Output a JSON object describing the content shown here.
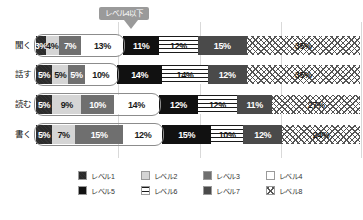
{
  "callout": {
    "text": "レベル4以下"
  },
  "legend": {
    "items": [
      {
        "label": "レベル1",
        "key": "lv1",
        "color": "#2b2b2b"
      },
      {
        "label": "レベル2",
        "key": "lv2",
        "color": "#d5d5d5"
      },
      {
        "label": "レベル3",
        "key": "lv3",
        "color": "#6f6f6f"
      },
      {
        "label": "レベル4",
        "key": "lv4",
        "color": "#ffffff"
      },
      {
        "label": "レベル5",
        "key": "lv5",
        "color": "#111111"
      },
      {
        "label": "レベル6",
        "key": "lv6",
        "color": "#ffffff"
      },
      {
        "label": "レベル7",
        "key": "lv7",
        "color": "#4a4a4a"
      },
      {
        "label": "レベル8",
        "key": "lv8",
        "color": "#ffffff"
      }
    ]
  },
  "chart_data": {
    "type": "bar",
    "orientation": "horizontal",
    "stacked": true,
    "title": "",
    "xlabel": "",
    "ylabel": "",
    "xlim": [
      0,
      100
    ],
    "grid": true,
    "legend_position": "bottom",
    "categories": [
      "聞く",
      "話す",
      "読む",
      "書く"
    ],
    "series": [
      {
        "name": "レベル1",
        "values": [
          3,
          5,
          5,
          5
        ]
      },
      {
        "name": "レベル2",
        "values": [
          4,
          5,
          9,
          7
        ]
      },
      {
        "name": "レベル3",
        "values": [
          7,
          5,
          10,
          15
        ]
      },
      {
        "name": "レベル4",
        "values": [
          13,
          10,
          14,
          12
        ]
      },
      {
        "name": "レベル5",
        "values": [
          11,
          14,
          12,
          15
        ]
      },
      {
        "name": "レベル6",
        "values": [
          12,
          14,
          12,
          10
        ]
      },
      {
        "name": "レベル7",
        "values": [
          15,
          12,
          11,
          12
        ]
      },
      {
        "name": "レベル8",
        "values": [
          35,
          35,
          27,
          24
        ]
      }
    ],
    "rows": [
      {
        "label": "聞く",
        "segments": [
          {
            "level": "レベル1",
            "value": 3,
            "label": "3%"
          },
          {
            "level": "レベル2",
            "value": 4,
            "label": "4%"
          },
          {
            "level": "レベル3",
            "value": 7,
            "label": "7%"
          },
          {
            "level": "レベル4",
            "value": 13,
            "label": "13%"
          },
          {
            "level": "レベル5",
            "value": 11,
            "label": "11%"
          },
          {
            "level": "レベル6",
            "value": 12,
            "label": "12%"
          },
          {
            "level": "レベル7",
            "value": 15,
            "label": "15%"
          },
          {
            "level": "レベル8",
            "value": 35,
            "label": "35%"
          }
        ]
      },
      {
        "label": "話す",
        "segments": [
          {
            "level": "レベル1",
            "value": 5,
            "label": "5%"
          },
          {
            "level": "レベル2",
            "value": 5,
            "label": "5%"
          },
          {
            "level": "レベル3",
            "value": 5,
            "label": "5%"
          },
          {
            "level": "レベル4",
            "value": 10,
            "label": "10%"
          },
          {
            "level": "レベル5",
            "value": 14,
            "label": "14%"
          },
          {
            "level": "レベル6",
            "value": 14,
            "label": "14%"
          },
          {
            "level": "レベル7",
            "value": 12,
            "label": "12%"
          },
          {
            "level": "レベル8",
            "value": 35,
            "label": "35%"
          }
        ]
      },
      {
        "label": "読む",
        "segments": [
          {
            "level": "レベル1",
            "value": 5,
            "label": "5%"
          },
          {
            "level": "レベル2",
            "value": 9,
            "label": "9%"
          },
          {
            "level": "レベル3",
            "value": 10,
            "label": "10%"
          },
          {
            "level": "レベル4",
            "value": 14,
            "label": "14%"
          },
          {
            "level": "レベル5",
            "value": 12,
            "label": "12%"
          },
          {
            "level": "レベル6",
            "value": 12,
            "label": "12%"
          },
          {
            "level": "レベル7",
            "value": 11,
            "label": "11%"
          },
          {
            "level": "レベル8",
            "value": 27,
            "label": "27%"
          }
        ]
      },
      {
        "label": "書く",
        "segments": [
          {
            "level": "レベル1",
            "value": 5,
            "label": "5%"
          },
          {
            "level": "レベル2",
            "value": 7,
            "label": "7%"
          },
          {
            "level": "レベル3",
            "value": 15,
            "label": "15%"
          },
          {
            "level": "レベル4",
            "value": 12,
            "label": "12%"
          },
          {
            "level": "レベル5",
            "value": 15,
            "label": "15%"
          },
          {
            "level": "レベル6",
            "value": 10,
            "label": "10%"
          },
          {
            "level": "レベル7",
            "value": 12,
            "label": "12%"
          },
          {
            "level": "レベル8",
            "value": 24,
            "label": "24%"
          }
        ]
      }
    ]
  }
}
